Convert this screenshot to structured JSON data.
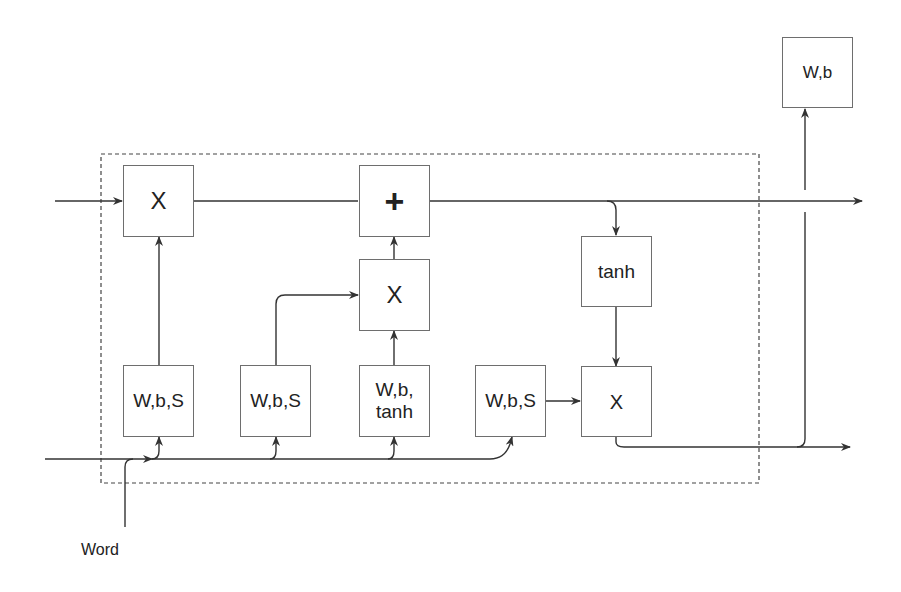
{
  "diagram": {
    "type": "LSTM cell block diagram",
    "boxes": {
      "forget_mult": {
        "label": "X"
      },
      "add": {
        "label": "+"
      },
      "input_mult": {
        "label": "X"
      },
      "tanh": {
        "label": "tanh"
      },
      "output_mult": {
        "label": "X"
      },
      "gate_forget": {
        "label": "W,b,S"
      },
      "gate_input": {
        "label": "W,b,S"
      },
      "gate_candidate": {
        "label": "W,b,\ntanh"
      },
      "gate_output": {
        "label": "W,b,S"
      },
      "output_layer": {
        "label": "W,b"
      }
    },
    "input_label": "Word",
    "colors": {
      "line": "#333333",
      "box_border": "#6e6e6e",
      "dashed_border": "#444444"
    }
  }
}
